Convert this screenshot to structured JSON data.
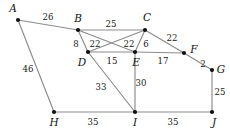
{
  "figure": {
    "type": "weighted-undirected-graph",
    "background_color": "#ffffff",
    "edge_color": "#8c8c8c",
    "node_color": "#111111",
    "text_color": "#111111"
  },
  "chart_data": {
    "type": "diagram",
    "title": "",
    "nodes": [
      {
        "id": "A",
        "label": "A",
        "x": 18,
        "y": 20,
        "label_x": 13,
        "label_y": 9
      },
      {
        "id": "B",
        "label": "B",
        "x": 78,
        "y": 30,
        "label_x": 78,
        "label_y": 19
      },
      {
        "id": "C",
        "label": "C",
        "x": 145,
        "y": 30,
        "label_x": 147,
        "label_y": 18
      },
      {
        "id": "D",
        "label": "D",
        "x": 88,
        "y": 52,
        "label_x": 82,
        "label_y": 63
      },
      {
        "id": "E",
        "label": "E",
        "x": 135,
        "y": 52,
        "label_x": 136,
        "label_y": 63
      },
      {
        "id": "F",
        "label": "F",
        "x": 184,
        "y": 53,
        "label_x": 194,
        "label_y": 50
      },
      {
        "id": "G",
        "label": "G",
        "x": 212,
        "y": 70,
        "label_x": 221,
        "label_y": 70
      },
      {
        "id": "H",
        "label": "H",
        "x": 54,
        "y": 112,
        "label_x": 54,
        "label_y": 123
      },
      {
        "id": "I",
        "label": "I",
        "x": 135,
        "y": 112,
        "label_x": 135,
        "label_y": 123
      },
      {
        "id": "J",
        "label": "J",
        "x": 212,
        "y": 112,
        "label_x": 214,
        "label_y": 123
      }
    ],
    "edges": [
      {
        "from": "A",
        "to": "B",
        "weight": "26",
        "label_x": 48,
        "label_y": 17
      },
      {
        "from": "A",
        "to": "H",
        "weight": "46",
        "label_x": 28,
        "label_y": 69
      },
      {
        "from": "B",
        "to": "C",
        "weight": "25",
        "label_x": 111,
        "label_y": 24
      },
      {
        "from": "B",
        "to": "D",
        "weight": "8",
        "label_x": 76,
        "label_y": 44
      },
      {
        "from": "B",
        "to": "E",
        "weight": "22",
        "label_x": 95,
        "label_y": 44
      },
      {
        "from": "C",
        "to": "D",
        "weight": "22",
        "label_x": 129,
        "label_y": 44
      },
      {
        "from": "C",
        "to": "E",
        "weight": "6",
        "label_x": 146,
        "label_y": 44
      },
      {
        "from": "C",
        "to": "F",
        "weight": "22",
        "label_x": 172,
        "label_y": 38
      },
      {
        "from": "D",
        "to": "E",
        "weight": "15",
        "label_x": 112,
        "label_y": 61
      },
      {
        "from": "D",
        "to": "I",
        "weight": "33",
        "label_x": 101,
        "label_y": 87
      },
      {
        "from": "E",
        "to": "F",
        "weight": "17",
        "label_x": 163,
        "label_y": 61
      },
      {
        "from": "E",
        "to": "I",
        "weight": "30",
        "label_x": 141,
        "label_y": 83
      },
      {
        "from": "F",
        "to": "G",
        "weight": "2",
        "label_x": 203,
        "label_y": 64
      },
      {
        "from": "G",
        "to": "J",
        "weight": "25",
        "label_x": 220,
        "label_y": 92
      },
      {
        "from": "H",
        "to": "I",
        "weight": "35",
        "label_x": 93,
        "label_y": 122
      },
      {
        "from": "I",
        "to": "J",
        "weight": "35",
        "label_x": 173,
        "label_y": 122
      }
    ]
  }
}
